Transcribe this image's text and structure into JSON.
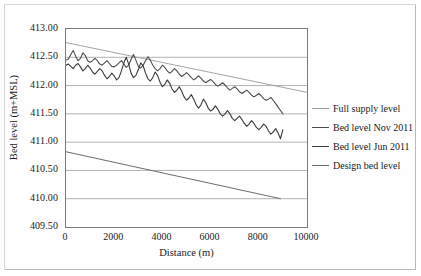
{
  "chart_data": {
    "type": "line",
    "title": "",
    "xlabel": "Distance (m)",
    "ylabel": "Bed level (m+MSL)",
    "xlim": [
      0,
      10000
    ],
    "ylim": [
      409.5,
      413.0
    ],
    "xticks": [
      "0",
      "2000",
      "4000",
      "6000",
      "8000",
      "10000"
    ],
    "xtick_values": [
      0,
      2000,
      4000,
      6000,
      8000,
      10000
    ],
    "yticks": [
      "409.50",
      "410.00",
      "410.50",
      "411.00",
      "411.50",
      "412.00",
      "412.50",
      "413.00"
    ],
    "ytick_values": [
      409.5,
      410.0,
      410.5,
      411.0,
      411.5,
      412.0,
      412.5,
      413.0
    ],
    "grid": "horizontal",
    "legend_position": "right",
    "series": [
      {
        "name": "Full supply level",
        "color": "#9a9a9a",
        "width": 0.9,
        "x": [
          0,
          10000
        ],
        "values": [
          412.76,
          411.88
        ]
      },
      {
        "name": "Bed level Nov 2011",
        "color": "#4d4d4d",
        "width": 1.1,
        "x": [
          0,
          100,
          200,
          300,
          400,
          500,
          600,
          700,
          800,
          900,
          1000,
          1100,
          1200,
          1300,
          1400,
          1500,
          1600,
          1700,
          1800,
          1900,
          2000,
          2100,
          2200,
          2300,
          2400,
          2500,
          2600,
          2700,
          2800,
          2900,
          3000,
          3100,
          3200,
          3300,
          3400,
          3500,
          3600,
          3700,
          3800,
          3900,
          4000,
          4100,
          4200,
          4300,
          4400,
          4500,
          4600,
          4700,
          4800,
          4900,
          5000,
          5100,
          5200,
          5300,
          5400,
          5500,
          5600,
          5700,
          5800,
          5900,
          6000,
          6100,
          6200,
          6300,
          6400,
          6500,
          6600,
          6700,
          6800,
          6900,
          7000,
          7100,
          7200,
          7300,
          7400,
          7500,
          7600,
          7700,
          7800,
          7900,
          8000,
          8100,
          8200,
          8300,
          8400,
          8500,
          8600,
          8700,
          8800,
          8900,
          9000
        ],
        "values": [
          412.45,
          412.47,
          412.55,
          412.62,
          412.52,
          412.44,
          412.48,
          412.58,
          412.53,
          412.44,
          412.41,
          412.44,
          412.48,
          412.44,
          412.38,
          412.36,
          412.4,
          412.44,
          412.39,
          412.34,
          412.33,
          412.36,
          412.4,
          412.44,
          412.38,
          412.32,
          412.36,
          412.46,
          412.55,
          412.45,
          412.34,
          412.31,
          412.36,
          412.44,
          412.51,
          412.45,
          412.36,
          412.3,
          412.26,
          412.3,
          412.36,
          412.32,
          412.26,
          412.22,
          412.25,
          412.3,
          412.26,
          412.2,
          412.16,
          412.19,
          412.23,
          412.19,
          412.14,
          412.1,
          412.13,
          412.17,
          412.13,
          412.08,
          412.05,
          412.08,
          412.11,
          412.07,
          412.02,
          411.99,
          412.02,
          412.05,
          412.01,
          411.96,
          411.92,
          411.95,
          411.98,
          411.94,
          411.89,
          411.86,
          411.89,
          411.92,
          411.88,
          411.83,
          411.8,
          411.83,
          411.86,
          411.82,
          411.77,
          411.74,
          411.76,
          411.79,
          411.74,
          411.68,
          411.62,
          411.56,
          411.5
        ]
      },
      {
        "name": "Bed level Jun 2011",
        "color": "#3a3a3a",
        "width": 1.1,
        "x": [
          0,
          100,
          200,
          300,
          400,
          500,
          600,
          700,
          800,
          900,
          1000,
          1100,
          1200,
          1300,
          1400,
          1500,
          1600,
          1700,
          1800,
          1900,
          2000,
          2100,
          2200,
          2300,
          2400,
          2500,
          2600,
          2700,
          2800,
          2900,
          3000,
          3100,
          3200,
          3300,
          3400,
          3500,
          3600,
          3700,
          3800,
          3900,
          4000,
          4100,
          4200,
          4300,
          4400,
          4500,
          4600,
          4700,
          4800,
          4900,
          5000,
          5100,
          5200,
          5300,
          5400,
          5500,
          5600,
          5700,
          5800,
          5900,
          6000,
          6100,
          6200,
          6300,
          6400,
          6500,
          6600,
          6700,
          6800,
          6900,
          7000,
          7100,
          7200,
          7300,
          7400,
          7500,
          7600,
          7700,
          7800,
          7900,
          8000,
          8100,
          8200,
          8300,
          8400,
          8500,
          8600,
          8700,
          8800,
          8900,
          9000
        ],
        "values": [
          412.36,
          412.38,
          412.34,
          412.3,
          412.36,
          412.39,
          412.33,
          412.26,
          412.3,
          412.36,
          412.31,
          412.24,
          412.2,
          412.25,
          412.3,
          412.26,
          412.18,
          412.12,
          412.16,
          412.22,
          412.17,
          412.1,
          412.14,
          412.26,
          412.4,
          412.5,
          412.38,
          412.22,
          412.14,
          412.18,
          412.28,
          412.4,
          412.35,
          412.22,
          412.12,
          412.08,
          412.14,
          412.24,
          412.18,
          412.06,
          411.98,
          412.02,
          412.1,
          412.04,
          411.94,
          411.88,
          411.92,
          411.98,
          411.9,
          411.8,
          411.74,
          411.78,
          411.84,
          411.76,
          411.66,
          411.6,
          411.66,
          411.76,
          411.7,
          411.6,
          411.55,
          411.58,
          411.64,
          411.58,
          411.5,
          411.46,
          411.5,
          411.56,
          411.5,
          411.42,
          411.38,
          411.42,
          411.46,
          411.4,
          411.33,
          411.28,
          411.32,
          411.38,
          411.33,
          411.26,
          411.22,
          411.26,
          411.32,
          411.28,
          411.2,
          411.14,
          411.18,
          411.24,
          411.16,
          411.06,
          411.22
        ]
      },
      {
        "name": "Design bed level",
        "color": "#6b6b6b",
        "width": 1.0,
        "x": [
          0,
          8900
        ],
        "values": [
          410.83,
          410.0
        ]
      }
    ]
  },
  "legend": {
    "items": [
      {
        "label": "Full supply level"
      },
      {
        "label": "Bed level Nov 2011"
      },
      {
        "label": "Bed level Jun 2011"
      },
      {
        "label": "Design bed level"
      }
    ]
  }
}
